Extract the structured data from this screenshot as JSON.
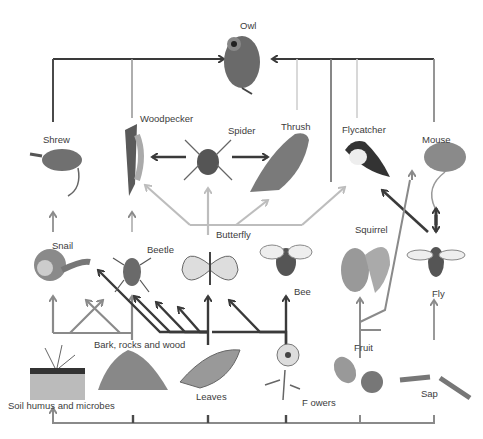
{
  "diagram": {
    "type": "food-web",
    "colors": {
      "dark_arrow": "#3a3a3a",
      "mid_arrow": "#8a8a8a",
      "light_arrow": "#bdbdbd",
      "illustration": "#5a5a5a"
    },
    "labels": {
      "owl": "Owl",
      "woodpecker": "Woodpecker",
      "spider": "Spider",
      "thrush": "Thrush",
      "flycatcher": "Flycatcher",
      "shrew": "Shrew",
      "mouse": "Mouse",
      "butterfly": "Butterfly",
      "snail": "Snail",
      "beetle": "Beetle",
      "bee": "Bee",
      "squirrel": "Squirrel",
      "fly": "Fly",
      "bark": "Bark, rocks and wood",
      "fruit": "Fruit",
      "soil": "Soil humus and microbes",
      "leaves": "Leaves",
      "flowers": "F owers",
      "sap": "Sap"
    },
    "feeding_links": [
      {
        "from": "Shrew",
        "to": "Owl"
      },
      {
        "from": "Woodpecker",
        "to": "Owl"
      },
      {
        "from": "Thrush",
        "to": "Owl"
      },
      {
        "from": "Squirrel",
        "to": "Owl"
      },
      {
        "from": "Flycatcher",
        "to": "Owl"
      },
      {
        "from": "Mouse",
        "to": "Owl"
      },
      {
        "from": "Spider",
        "to": "Woodpecker"
      },
      {
        "from": "Spider",
        "to": "Thrush"
      },
      {
        "from": "Butterfly",
        "to": "Woodpecker"
      },
      {
        "from": "Butterfly",
        "to": "Spider"
      },
      {
        "from": "Butterfly",
        "to": "Thrush"
      },
      {
        "from": "Butterfly",
        "to": "Flycatcher"
      },
      {
        "from": "Snail",
        "to": "Shrew"
      },
      {
        "from": "Beetle",
        "to": "Woodpecker"
      },
      {
        "from": "Fly",
        "to": "Flycatcher"
      },
      {
        "from": "Fly",
        "to": "Mouse"
      },
      {
        "from": "Squirrel",
        "to": "Mouse"
      },
      {
        "from": "Soil humus and microbes",
        "to": "Snail"
      },
      {
        "from": "Soil humus and microbes",
        "to": "Beetle"
      },
      {
        "from": "Bark, rocks and wood",
        "to": "Beetle"
      },
      {
        "from": "Leaves",
        "to": "Butterfly"
      },
      {
        "from": "Flowers",
        "to": "Bee"
      },
      {
        "from": "Flowers",
        "to": "Butterfly"
      },
      {
        "from": "Fruit",
        "to": "Squirrel"
      },
      {
        "from": "Sap",
        "to": "Fly"
      },
      {
        "from": "All producers",
        "to": "Soil humus and microbes"
      }
    ]
  }
}
